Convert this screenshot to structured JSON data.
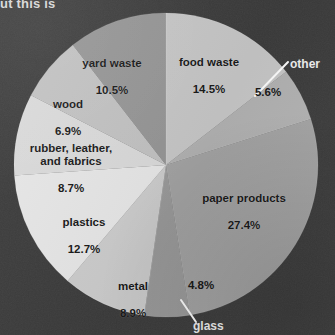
{
  "figure": {
    "clipped_caption": "ut this is",
    "background_color": "#3b3b3b",
    "label_text_color": "#1a1a1a",
    "callout_text_color": "#f2f2f2",
    "leader_line_color": "#ffffff"
  },
  "chart_data": {
    "type": "pie",
    "title": "",
    "xlabel": "",
    "ylabel": "",
    "legend_position": "none",
    "grid": false,
    "start_angle_deg": 0,
    "direction": "clockwise",
    "center": {
      "x": 166,
      "y": 165
    },
    "radius": 152,
    "categories": [
      "food waste",
      "other",
      "paper products",
      "glass",
      "metal",
      "plastics",
      "rubber, leather, and fabrics",
      "wood",
      "yard waste"
    ],
    "values": [
      14.5,
      5.6,
      27.4,
      4.8,
      8.9,
      12.7,
      8.7,
      6.9,
      10.5
    ],
    "value_labels": [
      "14.5%",
      "5.6%",
      "27.4%",
      "4.8%",
      "8.9%",
      "12.7%",
      "8.7%",
      "6.9%",
      "10.5%"
    ],
    "colors": [
      "#c9c9c9",
      "#b4b4b4",
      "#a6a6a6",
      "#9d9d9d",
      "#cfcfcf",
      "#e9e9e9",
      "#dcdcdc",
      "#c4c4c4",
      "#989898"
    ],
    "label_placement": [
      "inside",
      "outside",
      "inside",
      "outside",
      "inside",
      "inside",
      "inside",
      "inside",
      "inside"
    ]
  },
  "labels": {
    "food_waste": {
      "name": "food waste",
      "pct": "14.5%"
    },
    "yard_waste": {
      "name": "yard waste",
      "pct": "10.5%"
    },
    "wood": {
      "name": "wood",
      "pct": "6.9%"
    },
    "rubber": {
      "name": "rubber, leather,\nand fabrics",
      "pct": "8.7%"
    },
    "plastics": {
      "name": "plastics",
      "pct": "12.7%"
    },
    "metal": {
      "name": "metal",
      "pct": "8.9%"
    },
    "paper_products": {
      "name": "paper products",
      "pct": "27.4%"
    },
    "other": {
      "name": "other",
      "pct": "5.6%"
    },
    "glass": {
      "name": "glass",
      "pct": "4.8%"
    }
  }
}
